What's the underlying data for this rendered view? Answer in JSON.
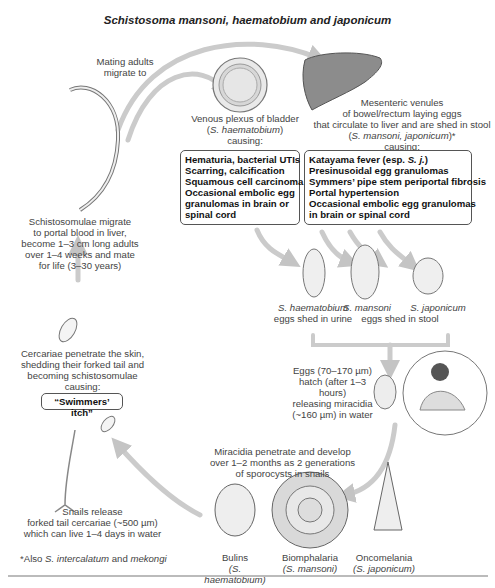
{
  "title": "Schistosoma mansoni, haematobium and japonicum",
  "labels": {
    "mating": [
      "Mating adults",
      "migrate to"
    ],
    "bladder": {
      "line1": "Venous plexus of bladder",
      "species": "S. haematobium",
      "causing": "causing:"
    },
    "mesenteric": {
      "line1": "Mesenteric venules",
      "line2": "of bowel/rectum laying eggs",
      "line3": "that circulate to liver and are shed in stool",
      "species": "S. mansoni, japonicum",
      "footnote_mark": "*",
      "causing": "causing:"
    },
    "schistosomulae": [
      "Schistosomulae migrate",
      "to portal blood in liver,",
      "become 1–3 cm long adults",
      "over 1–4 weeks and mate",
      "for life (3–30 years)"
    ],
    "cercariae": [
      "Cercariae penetrate the skin,",
      "shedding their forked tail and",
      "becoming schistosomulae",
      "causing:"
    ],
    "swimmers_itch": "“Swimmers’ itch”",
    "eggs": {
      "haematobium": "S. haematobium",
      "haematobium_shed": "eggs shed in urine",
      "mansoni": "S. mansoni",
      "japonicum": "S. japonicum",
      "stool_shed": "eggs shed in stool"
    },
    "hatch": [
      "Eggs (70–170 µm)",
      "hatch (after 1–3 hours)",
      "releasing miracidia",
      "(~160 µm) in water"
    ],
    "miracidia": [
      "Miracidia penetrate and develop",
      "over 1–2 months as 2 generations",
      "of sporocysts in snails"
    ],
    "snails_release": [
      "Snails release",
      "forked tail cercariae (~500 µm)",
      "which can live 1–4 days in water"
    ],
    "footnote": {
      "prefix": "*Also ",
      "sp1": "S. intercalatum",
      "mid": " and ",
      "sp2": "mekongi"
    },
    "snails": [
      {
        "name": "Bulins",
        "species": "(S. haematobium)"
      },
      {
        "name": "Biomphalaria",
        "species": "(S. mansoni)"
      },
      {
        "name": "Oncomelania",
        "species": "(S. japonicum)"
      }
    ]
  },
  "boxes": {
    "bladder": [
      "Hematuria, bacterial UTIs",
      "Scarring, calcification",
      "Squamous cell carcinoma",
      "Occasional embolic egg",
      "granulomas in brain or",
      "spinal cord"
    ],
    "mesenteric": {
      "first_prefix": "Katayama fever (esp. ",
      "first_species": "S. j.",
      "first_suffix": ")",
      "lines": [
        "Presinusoidal egg granulomas",
        "Symmers’ pipe stem periportal fibrosis",
        "Portal hypertension",
        "Occasional embolic egg granulomas",
        "in brain or spinal cord"
      ]
    }
  },
  "colors": {
    "arrow": "#c8c8c8",
    "organ": "#8a8a8a",
    "outline": "#666666",
    "text": "#444444"
  }
}
